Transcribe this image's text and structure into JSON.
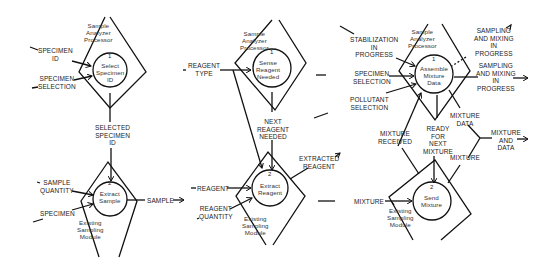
{
  "diagram": {
    "type": "data-flow-diagram",
    "panels": [
      {
        "id": "panel-1",
        "container": "Sample Analyzer Processor",
        "process_1": {
          "number": "1",
          "name": "Select Specimen ID"
        },
        "inputs_1": [
          "SPECIMEN ID",
          "SPECIMEN SELECTION"
        ],
        "flow_1_to_2": "SELECTED SPECIMEN ID",
        "container_2": "Existing Sampling Module",
        "process_2": {
          "number": "2",
          "name": "Extract Sample"
        },
        "inputs_2": [
          "SAMPLE QUANTITY",
          "SPECIMEN"
        ],
        "output": "SAMPLE"
      },
      {
        "id": "panel-2",
        "container": "Sample Analyzer Processor",
        "process_1": {
          "number": "1",
          "name": "Sense Reagent Needed"
        },
        "inputs_1": [
          "REAGENT TYPE"
        ],
        "flow_1_to_2": "NEXT REAGENT NEEDED",
        "container_2": "Existing Sampling Module",
        "process_2": {
          "number": "2",
          "name": "Extract Reagent"
        },
        "inputs_2": [
          "REAGENT",
          "REAGENT QUANTITY"
        ],
        "output": "EXTRACTED REAGENT"
      },
      {
        "id": "panel-3",
        "container": "Sample Analyzer Processor",
        "process_1": {
          "number": "1",
          "name": "Assemble Mixture Data"
        },
        "inputs_1": [
          "STABILIZATION IN PROGRESS",
          "SPECIMEN SELECTION",
          "POLLUTANT SELECTION"
        ],
        "outputs_1": [
          "SAMPLING AND MIXING IN PROGRESS",
          "SAMPLING AND MIXING IN PROGRESS",
          "MIXTURE DATA"
        ],
        "flows_between": [
          "MIXTURE RECEIVED",
          "READY FOR NEXT MIXTURE"
        ],
        "container_2": "Existing Sampling Module",
        "process_2": {
          "number": "2",
          "name": "Send Mixture"
        },
        "inputs_2": [
          "MIXTURE"
        ],
        "outputs_2": [
          "MIXTURE"
        ],
        "merged_output": "MIXTURE AND DATA"
      }
    ]
  },
  "labels": {
    "p1_container": "Sample\nAnalyzer\nProcessor",
    "p1_proc1_num": "1",
    "p1_proc1": "Select\nSpecimen\nID",
    "p1_in_a": "SPECIMEN\nID",
    "p1_in_b": "SPECIMEN\nSELECTION",
    "p1_mid": "SELECTED\nSPECIMEN\nID",
    "p1_proc2_num": "2",
    "p1_proc2": "Extract\nSample",
    "p1_in_c": "SAMPLE\nQUANTITY",
    "p1_in_d": "SPECIMEN",
    "p1_module": "Existing\nSampling\nModule",
    "p1_out": "SAMPLE",
    "p2_container": "Sample\nAnalyzer\nProcessor",
    "p2_proc1_num": "1",
    "p2_proc1": "Sense\nReagent\nNeeded",
    "p2_in_a": "REAGENT\nTYPE",
    "p2_mid": "NEXT\nREAGENT\nNEEDED",
    "p2_proc2_num": "2",
    "p2_proc2": "Extract\nReagent",
    "p2_in_b": "REAGENT",
    "p2_in_c": "REAGENT\nQUANTITY",
    "p2_module": "Existing\nSampling\nModule",
    "p2_out": "EXTRACTED\nREAGENT",
    "p3_container": "Sample\nAnalyzer\nProcessor",
    "p3_proc1_num": "1",
    "p3_proc1": "Assemble\nMixture\nData",
    "p3_in_a": "STABILIZATION\nIN\nPROGRESS",
    "p3_in_b": "SPECIMEN\nSELECTION",
    "p3_in_c": "POLLUTANT\nSELECTION",
    "p3_out_a": "SAMPLING\nAND MIXING\nIN\nPROGRESS",
    "p3_out_b": "SAMPLING\nAND MIXING\nIN\nPROGRESS",
    "p3_mixture_data": "MIXTURE\nDATA",
    "p3_received": "MIXTURE\nRECEIVED",
    "p3_ready": "READY\nFOR\nNEXT\nMIXTURE",
    "p3_merged": "MIXTURE\nAND\nDATA",
    "p3_mixture_out": "MIXTURE",
    "p3_proc2_num": "2",
    "p3_proc2": "Send\nMixture",
    "p3_in_d": "MIXTURE",
    "p3_module": "Existing\nSampling\nModule"
  }
}
